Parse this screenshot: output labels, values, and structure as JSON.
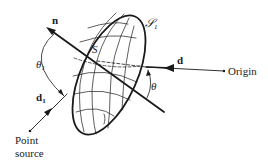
{
  "diagram": {
    "labels": {
      "normal": "n",
      "surface_point": "S",
      "surface_name": "𝒮",
      "surface_sub": "1",
      "theta1": "θ",
      "theta1_sub": "1",
      "theta": "θ",
      "direction": "d",
      "direction1": "d",
      "direction1_sub": "1",
      "origin": "Origin",
      "point_source_line1": "Point",
      "point_source_line2": "source"
    },
    "colors": {
      "stroke": "#1a1a1a",
      "background": "#ffffff"
    }
  }
}
